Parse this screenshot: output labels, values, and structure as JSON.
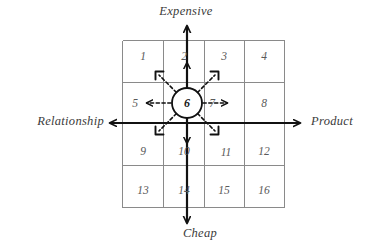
{
  "diagram": {
    "title_axes": {
      "top": "Expensive",
      "bottom": "Cheap",
      "left": "Relationship",
      "right": "Product"
    },
    "grid": {
      "rows": 4,
      "columns": 4,
      "cells": [
        "1",
        "2",
        "3",
        "4",
        "5",
        "6",
        "7",
        "8",
        "9",
        "10",
        "11",
        "12",
        "13",
        "14",
        "15",
        "16"
      ]
    },
    "center": {
      "label": "6",
      "shape": "circle",
      "arrow_count": 8,
      "arrow_style": "dashed"
    },
    "colors": {
      "grid_line": "#8a8a8a",
      "axis_line": "#111111",
      "cell_text": "#5a5a5a",
      "label_text": "#3a3a3a",
      "background": "#ffffff"
    }
  }
}
